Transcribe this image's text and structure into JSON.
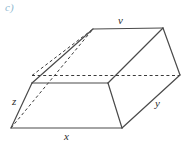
{
  "figure": {
    "part_label": "c)",
    "part_label_color": "#8fb8cf",
    "stroke_color": "#4a4a4a",
    "hidden_stroke_color": "#3a3a3a",
    "background": "#ffffff",
    "caption_font_style": "italic",
    "shape_name": "trapezoidal-prism",
    "edge_labels": {
      "top": "v",
      "right": "y",
      "left": "z",
      "bottom": "x"
    },
    "vertices": {
      "bottom_front_left": [
        11,
        128
      ],
      "bottom_front_right": [
        122,
        128
      ],
      "mid_front_left": [
        32,
        83
      ],
      "mid_front_right": [
        108,
        83
      ],
      "top_back_left": [
        93,
        29
      ],
      "top_back_right": [
        163,
        28
      ],
      "right_mid_back": [
        180,
        75
      ],
      "hidden_left": [
        32,
        83
      ]
    },
    "line_styles": {
      "visible": "solid",
      "hidden": "dashed"
    }
  }
}
